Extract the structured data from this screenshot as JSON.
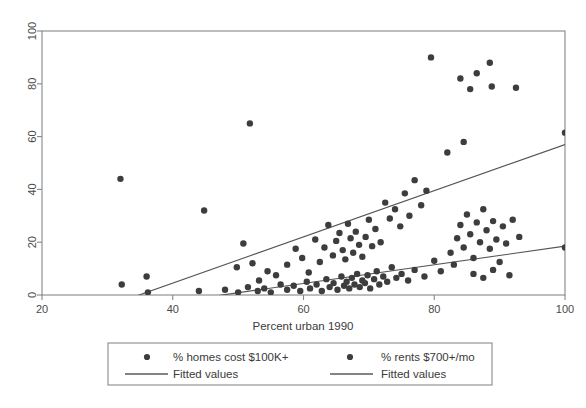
{
  "chart_data": {
    "type": "scatter",
    "title": "",
    "xlabel": "Percent urban 1990",
    "ylabel": "",
    "xlim": [
      20,
      100
    ],
    "ylim": [
      0,
      100
    ],
    "xticks": [
      20,
      40,
      60,
      80,
      100
    ],
    "yticks": [
      0,
      20,
      40,
      60,
      80,
      100
    ],
    "xtick_labels": [
      "20",
      "40",
      "60",
      "80",
      "100"
    ],
    "ytick_labels": [
      "0",
      "20",
      "40",
      "60",
      "80",
      "100"
    ],
    "grid": false,
    "legend_position": "below-axes",
    "marker_color": "#3d3d3d",
    "line_color": "#555555",
    "series": [
      {
        "name": "% homes cost $100K+",
        "marker": "filled-circle",
        "points": [
          [
            32.0,
            44.0
          ],
          [
            32.2,
            4.0
          ],
          [
            36.0,
            7.0
          ],
          [
            44.8,
            32.0
          ],
          [
            51.8,
            65.0
          ],
          [
            49.8,
            10.5
          ],
          [
            50.8,
            19.5
          ],
          [
            52.2,
            12.0
          ],
          [
            53.2,
            5.5
          ],
          [
            54.5,
            9.0
          ],
          [
            55.8,
            7.5
          ],
          [
            57.5,
            11.5
          ],
          [
            58.8,
            17.5
          ],
          [
            59.8,
            14.0
          ],
          [
            60.8,
            8.5
          ],
          [
            61.8,
            21.0
          ],
          [
            62.5,
            12.5
          ],
          [
            63.2,
            18.0
          ],
          [
            63.8,
            26.5
          ],
          [
            64.5,
            15.0
          ],
          [
            65.0,
            20.5
          ],
          [
            65.5,
            23.5
          ],
          [
            66.0,
            17.0
          ],
          [
            66.4,
            13.5
          ],
          [
            66.8,
            27.0
          ],
          [
            67.2,
            21.5
          ],
          [
            67.6,
            16.0
          ],
          [
            68.0,
            24.0
          ],
          [
            68.5,
            19.0
          ],
          [
            69.0,
            14.5
          ],
          [
            69.5,
            22.0
          ],
          [
            70.0,
            28.5
          ],
          [
            70.5,
            18.5
          ],
          [
            71.0,
            25.0
          ],
          [
            71.8,
            20.0
          ],
          [
            72.5,
            35.0
          ],
          [
            73.2,
            29.0
          ],
          [
            74.0,
            32.5
          ],
          [
            74.8,
            26.0
          ],
          [
            75.5,
            38.5
          ],
          [
            76.2,
            30.0
          ],
          [
            77.0,
            43.5
          ],
          [
            78.0,
            34.0
          ],
          [
            78.8,
            39.5
          ],
          [
            79.5,
            90.0
          ],
          [
            84.0,
            82.0
          ],
          [
            86.5,
            84.0
          ],
          [
            85.5,
            78.0
          ],
          [
            88.5,
            88.0
          ],
          [
            88.8,
            79.0
          ],
          [
            92.5,
            78.5
          ],
          [
            100.0,
            61.5
          ],
          [
            82.0,
            54.0
          ],
          [
            84.5,
            58.0
          ]
        ]
      },
      {
        "name": "% rents $700+/mo",
        "marker": "filled-circle",
        "points": [
          [
            36.2,
            1.0
          ],
          [
            44.0,
            1.5
          ],
          [
            48.0,
            2.0
          ],
          [
            50.0,
            1.0
          ],
          [
            51.5,
            3.0
          ],
          [
            53.0,
            1.5
          ],
          [
            54.0,
            2.5
          ],
          [
            55.0,
            1.0
          ],
          [
            56.5,
            4.0
          ],
          [
            57.5,
            2.0
          ],
          [
            58.5,
            3.5
          ],
          [
            59.5,
            1.5
          ],
          [
            60.5,
            5.0
          ],
          [
            61.0,
            2.5
          ],
          [
            62.0,
            4.0
          ],
          [
            62.8,
            1.5
          ],
          [
            63.5,
            6.0
          ],
          [
            64.0,
            3.0
          ],
          [
            64.6,
            4.5
          ],
          [
            65.2,
            2.0
          ],
          [
            65.8,
            7.0
          ],
          [
            66.2,
            3.5
          ],
          [
            66.6,
            5.0
          ],
          [
            67.0,
            2.5
          ],
          [
            67.4,
            6.5
          ],
          [
            67.8,
            4.0
          ],
          [
            68.2,
            8.0
          ],
          [
            68.6,
            3.0
          ],
          [
            69.0,
            5.5
          ],
          [
            69.4,
            4.5
          ],
          [
            69.8,
            7.5
          ],
          [
            70.2,
            2.5
          ],
          [
            70.8,
            6.0
          ],
          [
            71.2,
            9.0
          ],
          [
            71.6,
            4.0
          ],
          [
            72.2,
            7.0
          ],
          [
            72.8,
            5.0
          ],
          [
            73.5,
            10.5
          ],
          [
            74.2,
            6.5
          ],
          [
            75.0,
            8.0
          ],
          [
            76.0,
            5.5
          ],
          [
            77.0,
            9.5
          ],
          [
            78.5,
            7.0
          ],
          [
            80.0,
            13.0
          ],
          [
            81.0,
            9.0
          ],
          [
            82.5,
            16.0
          ],
          [
            83.0,
            11.5
          ],
          [
            83.5,
            21.5
          ],
          [
            84.0,
            26.5
          ],
          [
            84.5,
            18.0
          ],
          [
            85.0,
            30.5
          ],
          [
            85.5,
            23.0
          ],
          [
            86.0,
            14.0
          ],
          [
            86.5,
            27.5
          ],
          [
            87.0,
            20.0
          ],
          [
            87.5,
            32.5
          ],
          [
            88.0,
            24.5
          ],
          [
            88.5,
            17.5
          ],
          [
            89.0,
            28.0
          ],
          [
            89.5,
            21.0
          ],
          [
            90.0,
            12.5
          ],
          [
            90.5,
            26.0
          ],
          [
            91.0,
            19.5
          ],
          [
            92.0,
            28.5
          ],
          [
            93.0,
            22.0
          ],
          [
            100.0,
            18.0
          ],
          [
            86.0,
            8.0
          ],
          [
            87.5,
            6.5
          ],
          [
            89.0,
            9.5
          ],
          [
            91.5,
            7.5
          ]
        ]
      }
    ],
    "fitted_lines": [
      {
        "name": "Fitted values (homes)",
        "x_start": 32.0,
        "y_start": -2.5,
        "x_end": 100.0,
        "y_end": 57.0
      },
      {
        "name": "Fitted values (rents)",
        "x_start": 32.0,
        "y_start": -5.5,
        "x_end": 100.0,
        "y_end": 18.5
      }
    ]
  },
  "legend": {
    "entries": [
      {
        "label": "% homes cost $100K+",
        "marker": "filled-circle"
      },
      {
        "label": "% rents $700+/mo",
        "marker": "filled-circle"
      },
      {
        "label": "Fitted values",
        "marker": "line"
      },
      {
        "label": "Fitted values",
        "marker": "line"
      }
    ]
  }
}
